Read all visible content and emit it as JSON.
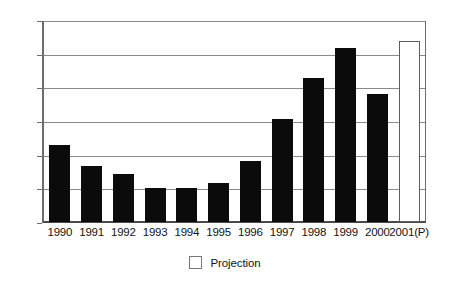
{
  "chart_data": {
    "type": "bar",
    "title": "",
    "subtitle": "",
    "xlabel": "",
    "ylabel": "",
    "categories": [
      "1990",
      "1991",
      "1992",
      "1993",
      "1994",
      "1995",
      "1996",
      "1997",
      "1998",
      "1999",
      "2000",
      "2001(P)"
    ],
    "values": [
      69,
      50,
      43,
      30,
      30,
      35,
      54,
      92,
      128,
      155,
      114,
      161
    ],
    "series": [
      {
        "name": "Actual",
        "values": [
          69,
          50,
          43,
          30,
          30,
          35,
          54,
          92,
          128,
          155,
          114,
          null
        ]
      },
      {
        "name": "Projection",
        "values": [
          null,
          null,
          null,
          null,
          null,
          null,
          null,
          null,
          null,
          null,
          null,
          161
        ]
      }
    ],
    "bar_styles": [
      "solid",
      "solid",
      "solid",
      "solid",
      "solid",
      "solid",
      "solid",
      "solid",
      "solid",
      "solid",
      "solid",
      "hollow"
    ],
    "ylim": [
      0,
      180
    ],
    "ytick_values": [
      0,
      30,
      60,
      90,
      120,
      150,
      180
    ],
    "ytick_labels": [
      "0",
      "30",
      "60",
      "90",
      "120",
      "150",
      "180"
    ],
    "grid": true,
    "grid_axis": "y",
    "legend_position": "bottom-center",
    "legend": [
      {
        "label": "Projection",
        "swatch": "hollow"
      }
    ],
    "colors": {
      "bar_solid": "#0b0b0b",
      "bar_hollow_fill": "#ffffff",
      "bar_hollow_border": "#5e5e5e",
      "gridline": "#8a8a8a",
      "axis": "#6d6d6d",
      "text": "#141414",
      "background": "#ffffff"
    }
  }
}
